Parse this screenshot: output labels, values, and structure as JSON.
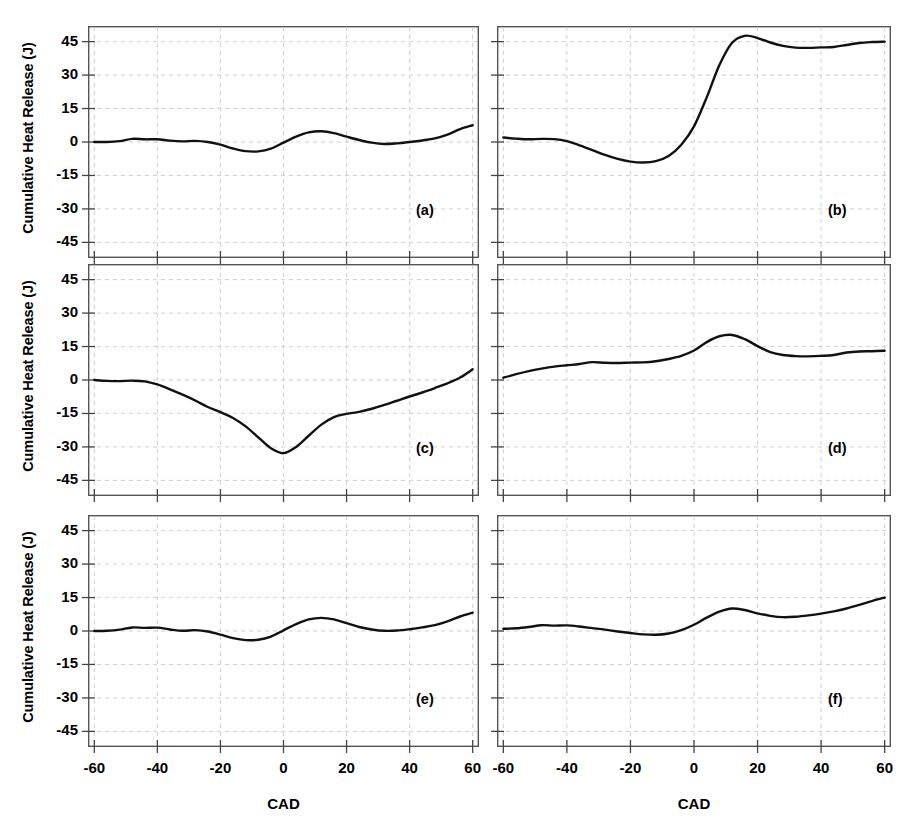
{
  "figure": {
    "background": "#ffffff",
    "curve_color": "#111111",
    "grid_color": "#c9c9c9",
    "axis_color": "#555555"
  },
  "axes": {
    "ylabel": "Cumulative Heat Release (J)",
    "xlabel": "CAD",
    "yticks": [
      "45",
      "30",
      "15",
      "0",
      "-15",
      "-30",
      "-45"
    ],
    "ytick_values": [
      45,
      30,
      15,
      0,
      -15,
      -30,
      -45
    ],
    "xticks": [
      "-60",
      "-40",
      "-20",
      "0",
      "20",
      "40",
      "60"
    ],
    "xtick_values": [
      -60,
      -40,
      -20,
      0,
      20,
      40,
      60
    ],
    "ylim": [
      -52,
      52
    ],
    "xlim": [
      -62,
      62
    ],
    "grid": true
  },
  "chart_data": {
    "type": "line",
    "title": "",
    "xlabel": "CAD",
    "ylabel": "Cumulative Heat Release (J)",
    "xlim": [
      -62,
      62
    ],
    "ylim": [
      -52,
      52
    ],
    "grid": true,
    "legend": "none",
    "layout": {
      "rows": 3,
      "cols": 2
    },
    "panels": [
      {
        "id": "a",
        "label": "(a)",
        "row": 0,
        "col": 0,
        "x": [
          -60,
          -56,
          -52,
          -48,
          -44,
          -40,
          -36,
          -32,
          -28,
          -24,
          -20,
          -16,
          -12,
          -8,
          -4,
          0,
          4,
          8,
          12,
          16,
          20,
          24,
          28,
          32,
          36,
          40,
          44,
          48,
          52,
          56,
          60
        ],
        "values": [
          0.0,
          0.0,
          0.4,
          1.4,
          1.2,
          1.2,
          0.6,
          0.3,
          0.5,
          0.0,
          -1.2,
          -2.9,
          -4.1,
          -4.2,
          -3.0,
          -0.3,
          2.4,
          4.3,
          4.8,
          4.0,
          2.4,
          0.9,
          -0.3,
          -0.9,
          -0.6,
          0.0,
          0.7,
          1.6,
          3.3,
          5.8,
          7.5
        ]
      },
      {
        "id": "b",
        "label": "(b)",
        "row": 0,
        "col": 1,
        "x": [
          -60,
          -56,
          -52,
          -48,
          -44,
          -40,
          -36,
          -32,
          -28,
          -24,
          -20,
          -16,
          -12,
          -8,
          -4,
          0,
          4,
          8,
          12,
          16,
          20,
          24,
          28,
          32,
          36,
          40,
          44,
          48,
          52,
          56,
          60
        ],
        "values": [
          2.0,
          1.5,
          1.2,
          1.4,
          1.3,
          0.4,
          -1.5,
          -3.6,
          -5.8,
          -7.6,
          -8.8,
          -9.2,
          -8.6,
          -6.3,
          -1.2,
          7.0,
          20.0,
          34.5,
          44.5,
          47.6,
          46.6,
          44.6,
          43.1,
          42.3,
          42.2,
          42.4,
          42.6,
          43.5,
          44.4,
          44.8,
          45.0
        ]
      },
      {
        "id": "c",
        "label": "(c)",
        "row": 1,
        "col": 0,
        "x": [
          -60,
          -56,
          -52,
          -48,
          -44,
          -40,
          -36,
          -32,
          -28,
          -24,
          -20,
          -16,
          -12,
          -8,
          -4,
          0,
          4,
          8,
          12,
          16,
          20,
          24,
          28,
          32,
          36,
          40,
          44,
          48,
          52,
          56,
          60
        ],
        "values": [
          0.0,
          -0.4,
          -0.5,
          -0.3,
          -0.6,
          -2.0,
          -4.2,
          -6.6,
          -9.2,
          -12.1,
          -14.4,
          -17.0,
          -20.8,
          -25.7,
          -30.6,
          -32.8,
          -30.0,
          -25.0,
          -20.0,
          -16.6,
          -15.2,
          -14.3,
          -12.9,
          -11.2,
          -9.3,
          -7.4,
          -5.6,
          -3.6,
          -1.5,
          1.1,
          4.8
        ]
      },
      {
        "id": "d",
        "label": "(d)",
        "row": 1,
        "col": 1,
        "x": [
          -60,
          -56,
          -52,
          -48,
          -44,
          -40,
          -36,
          -32,
          -28,
          -24,
          -20,
          -16,
          -12,
          -8,
          -4,
          0,
          4,
          8,
          12,
          16,
          20,
          24,
          28,
          32,
          36,
          40,
          44,
          48,
          52,
          56,
          60
        ],
        "values": [
          1.0,
          2.6,
          4.0,
          5.1,
          6.0,
          6.6,
          7.2,
          8.0,
          7.7,
          7.6,
          7.8,
          7.9,
          8.4,
          9.4,
          10.8,
          13.2,
          17.0,
          19.6,
          20.2,
          18.3,
          15.2,
          12.5,
          11.2,
          10.7,
          10.6,
          10.8,
          11.2,
          12.3,
          12.8,
          12.9,
          13.1
        ]
      },
      {
        "id": "e",
        "label": "(e)",
        "row": 2,
        "col": 0,
        "x": [
          -60,
          -56,
          -52,
          -48,
          -44,
          -40,
          -36,
          -32,
          -28,
          -24,
          -20,
          -16,
          -12,
          -8,
          -4,
          0,
          4,
          8,
          12,
          16,
          20,
          24,
          28,
          32,
          36,
          40,
          44,
          48,
          52,
          56,
          60
        ],
        "values": [
          0.0,
          0.1,
          0.6,
          1.6,
          1.4,
          1.5,
          0.7,
          0.1,
          0.4,
          -0.2,
          -1.6,
          -3.2,
          -4.1,
          -3.9,
          -2.5,
          0.3,
          3.1,
          5.2,
          5.9,
          5.2,
          3.5,
          1.8,
          0.7,
          0.1,
          0.2,
          0.8,
          1.6,
          2.6,
          4.3,
          6.5,
          8.2
        ]
      },
      {
        "id": "f",
        "label": "(f)",
        "row": 2,
        "col": 1,
        "x": [
          -60,
          -56,
          -52,
          -48,
          -44,
          -40,
          -36,
          -32,
          -28,
          -24,
          -20,
          -16,
          -12,
          -8,
          -4,
          0,
          4,
          8,
          12,
          16,
          20,
          24,
          28,
          32,
          36,
          40,
          44,
          48,
          52,
          56,
          60
        ],
        "values": [
          1.0,
          1.2,
          1.8,
          2.6,
          2.4,
          2.5,
          2.0,
          1.3,
          0.6,
          -0.2,
          -0.9,
          -1.5,
          -1.7,
          -1.1,
          0.4,
          2.8,
          6.0,
          8.7,
          10.1,
          9.4,
          7.9,
          6.8,
          6.2,
          6.4,
          7.0,
          7.8,
          8.8,
          10.1,
          11.7,
          13.4,
          15.0
        ]
      }
    ]
  }
}
